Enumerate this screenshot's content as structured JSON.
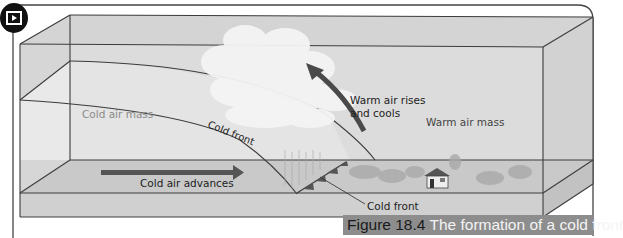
{
  "figure": {
    "number": "Figure 18.4",
    "title": "The formation of a cold front",
    "media_icon": "video-play-icon"
  },
  "labels": {
    "cold_air_mass": "Cold air mass",
    "cold_front_curve": "Cold front",
    "warm_air_rises_line1": "Warm air rises",
    "warm_air_rises_line2": "and cools",
    "warm_air_mass": "Warm air mass",
    "cold_air_advances": "Cold air advances",
    "cold_front_pointer": "Cold front"
  },
  "colors": {
    "box_fill": "#d9d9d9",
    "box_face": "#e6e6e6",
    "ground": "#c8c8c8",
    "base": "#d2d2d2",
    "arrow": "#5a5a5a",
    "line": "#3c3c3c",
    "caption_bg": "#8d8d8d"
  }
}
